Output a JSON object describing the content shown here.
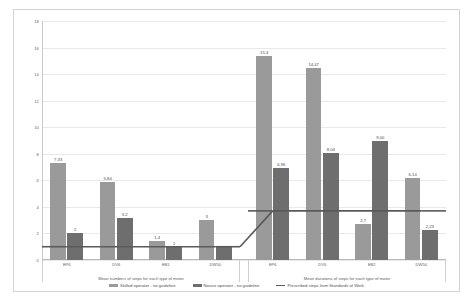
{
  "chart_data": {
    "type": "bar",
    "title": "",
    "xlabel": "",
    "ylabel": "",
    "ylim": [
      0,
      18
    ],
    "ytick_step": 2,
    "yticks": [
      "0",
      "2",
      "4",
      "6",
      "8",
      "10",
      "12",
      "14",
      "16",
      "18"
    ],
    "grid": true,
    "legend_position": "bottom",
    "panels": [
      {
        "title": "Mean numbers of steps for each type of motor",
        "categories": [
          "EP6",
          "DV6",
          "EB1",
          "DW50"
        ],
        "series": [
          {
            "name": "Skilled operator - no guideline",
            "values": [
              7.33,
              5.84,
              1.4,
              3
            ],
            "labels": [
              "7,33",
              "5,84",
              "1,4",
              "3"
            ]
          },
          {
            "name": "Novice operator - no guideline",
            "values": [
              2,
              3.2,
              1,
              1
            ],
            "labels": [
              "2",
              "3,2",
              "1",
              ""
            ]
          }
        ],
        "line_series": {
          "name": "Prescribed steps from Standards of Work",
          "values": [
            1,
            1,
            1,
            1
          ]
        }
      },
      {
        "title": "Mean durations of steps for each type of motor",
        "categories": [
          "EP6",
          "DV6",
          "EB2",
          "DW50"
        ],
        "series": [
          {
            "name": "Skilled operator - no guideline",
            "values": [
              15.4,
              14.47,
              2.7,
              6.14
            ],
            "labels": [
              "15,4",
              "14,47",
              "2,7",
              "6,14"
            ]
          },
          {
            "name": "Novice operator - no guideline",
            "values": [
              6.96,
              8.03,
              9.0,
              2.23
            ],
            "labels": [
              "6,96",
              "8,03",
              "9,00",
              "2,23"
            ]
          }
        ],
        "line_series": {
          "name": "Prescribed steps from Standards of Work",
          "values": [
            3.7,
            3.7,
            3.7,
            3.7
          ]
        }
      }
    ],
    "legend": [
      {
        "label": "Skilled operator - no guideline",
        "type": "bar",
        "color": "#9a9a9a"
      },
      {
        "label": "Novice operator - no guideline",
        "type": "bar",
        "color": "#6e6e6e"
      },
      {
        "label": "Prescribed steps from Standards of Work",
        "type": "line",
        "color": "#5a5a5a"
      }
    ],
    "colors": {
      "skilled": "#9a9a9a",
      "novice": "#6e6e6e",
      "line": "#5a5a5a",
      "grid": "#e9e9e9",
      "axis": "#c8c8c8",
      "text": "#5d5d5d",
      "background": "#ffffff"
    }
  }
}
